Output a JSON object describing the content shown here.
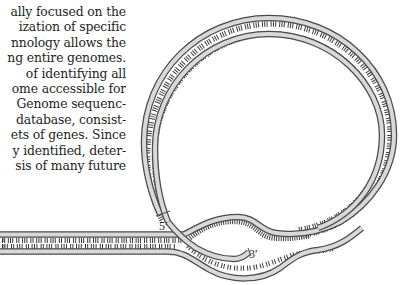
{
  "text_fragment": {
    "lines": [
      "ally focused on the",
      "ization of specific",
      "nnology allows the",
      "ng entire genomes.",
      " of identifying all",
      "ome accessible for",
      " Genome sequenc-",
      " database, consist-",
      "ets of genes. Since",
      "y identified, deter-",
      "sis of many future"
    ]
  },
  "figure": {
    "labels": {
      "five_prime": "5′",
      "three_prime": "3′"
    },
    "colors": {
      "strand_fill": "#d9d9d9",
      "strand_outline": "#4a4a4a",
      "tick": "#3a3a3a",
      "text": "#231f20"
    }
  }
}
